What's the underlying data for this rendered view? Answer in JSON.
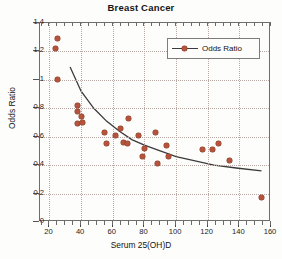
{
  "chart_data": {
    "type": "scatter",
    "title": "Breast Cancer",
    "xlabel": "Serum 25(OH)D",
    "ylabel": "Odds Ratio",
    "xlim": [
      14,
      160
    ],
    "ylim": [
      0,
      1.4
    ],
    "xticks": [
      20,
      40,
      60,
      80,
      100,
      120,
      140,
      160
    ],
    "yticks": [
      "0",
      "0.2",
      "0.4",
      "0.6",
      "0.8",
      "1",
      "1.2",
      "1.4"
    ],
    "ytick_values": [
      0,
      0.2,
      0.4,
      0.6,
      0.8,
      1.0,
      1.2,
      1.4
    ],
    "grid": true,
    "legend_position": "top-right",
    "legend": [
      "Odds Ratio"
    ],
    "marker_color": "#b4543c",
    "line_color": "#3b3b3b",
    "series": [
      {
        "name": "Odds Ratio",
        "marker": "circle",
        "points": [
          [
            25,
            1.29
          ],
          [
            24,
            1.22
          ],
          [
            25,
            1.0
          ],
          [
            38,
            0.82
          ],
          [
            38,
            0.78
          ],
          [
            38,
            0.69
          ],
          [
            40,
            0.74
          ],
          [
            41,
            0.7
          ],
          [
            55,
            0.63
          ],
          [
            56,
            0.55
          ],
          [
            62,
            0.61
          ],
          [
            65,
            0.66
          ],
          [
            67,
            0.56
          ],
          [
            69,
            0.55
          ],
          [
            70,
            0.73
          ],
          [
            76,
            0.61
          ],
          [
            79,
            0.46
          ],
          [
            80,
            0.52
          ],
          [
            87,
            0.63
          ],
          [
            88,
            0.41
          ],
          [
            94,
            0.54
          ],
          [
            95,
            0.46
          ],
          [
            117,
            0.51
          ],
          [
            123,
            0.51
          ],
          [
            127,
            0.55
          ],
          [
            134,
            0.43
          ],
          [
            154,
            0.17
          ]
        ]
      },
      {
        "name": "Odds Ratio fitted curve",
        "type": "line",
        "points": [
          [
            33,
            1.09
          ],
          [
            40,
            0.92
          ],
          [
            48,
            0.8
          ],
          [
            56,
            0.71
          ],
          [
            64,
            0.64
          ],
          [
            72,
            0.58
          ],
          [
            80,
            0.54
          ],
          [
            90,
            0.5
          ],
          [
            100,
            0.46
          ],
          [
            112,
            0.43
          ],
          [
            124,
            0.4
          ],
          [
            138,
            0.38
          ],
          [
            154,
            0.36
          ]
        ]
      }
    ]
  }
}
